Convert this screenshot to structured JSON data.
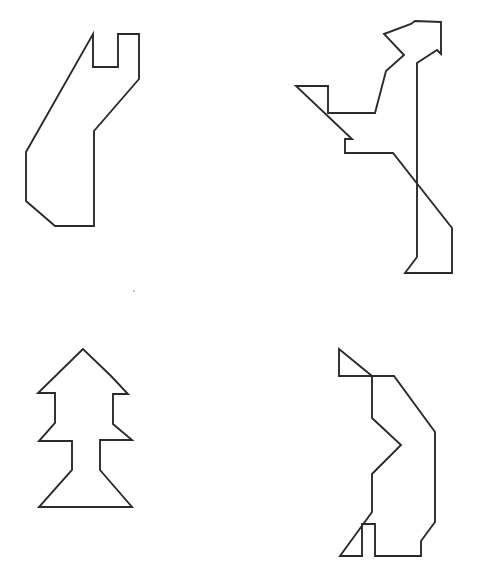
{
  "page": {
    "background_color": "#ffffff",
    "width": 487,
    "height": 583,
    "stroke_color": "#2b2b2b",
    "stroke_width": 1.9
  },
  "figures": [
    {
      "id": "top-left",
      "name": "cat-silhouette-outline",
      "label": "Top-left figure",
      "closed": true,
      "vertex_count": 11,
      "points": "93,34 93,67 118,67 118,34 139,34 139,79 94,131 94,226 55,226 26,201 26,152",
      "bbox": {
        "x": 25,
        "y": 33,
        "width": 115,
        "height": 195
      }
    },
    {
      "id": "top-right",
      "name": "arrow-bird-outline",
      "label": "Top-right figure",
      "closed": true,
      "vertex_count": 19,
      "points": "415,21 411,24 384,34 404,55 386,71 375,113 328,113 328,86 296,86 352,139 345,139 345,153 393,153 452,228 452,273 405,273 417,257 417,63 437,50 441,54 441,22",
      "bbox": {
        "x": 295,
        "y": 20,
        "width": 175,
        "height": 255
      }
    },
    {
      "id": "bottom-left",
      "name": "upward-arrow-outline",
      "label": "Bottom-left figure",
      "closed": true,
      "vertex_count": 16,
      "points": "83,349 38,393 55,393 55,423 39,441 72,441 72,470 39,507 132,507 100,470 100,440 132,440 113,424 113,394 128,394 111,376",
      "bbox": {
        "x": 37,
        "y": 348,
        "width": 97,
        "height": 161
      }
    },
    {
      "id": "bottom-right",
      "name": "standing-figure-outline",
      "label": "Bottom-right figure",
      "closed": true,
      "vertex_count": 16,
      "points": "339,349 339,376 370,376 394,376 435,432 435,522 421,541 421,556 375,556 375,524 362,524 362,556 340,556 372,512 372,474 401,445 372,418 372,376",
      "bbox": {
        "x": 337,
        "y": 347,
        "width": 100,
        "height": 212
      }
    }
  ],
  "artifacts": [
    {
      "name": "dust-speck",
      "x": 134,
      "y": 291,
      "radius": 1.2,
      "color": "#c9c9c9"
    }
  ]
}
